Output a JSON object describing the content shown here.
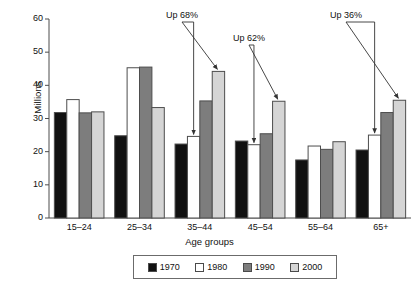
{
  "chart_data": {
    "type": "bar",
    "title": "",
    "subtitle": "",
    "xlabel": "Age groups",
    "ylabel": "Millions",
    "categories": [
      "15–24",
      "25–34",
      "35–44",
      "45–54",
      "55–64",
      "65+"
    ],
    "series": [
      {
        "name": "1970",
        "color": "#111111",
        "values": [
          31.8,
          24.8,
          22.3,
          23.2,
          17.5,
          20.5
        ]
      },
      {
        "name": "1980",
        "color": "#ffffff",
        "values": [
          35.7,
          45.3,
          24.6,
          22.1,
          21.7,
          25.0
        ]
      },
      {
        "name": "1990",
        "color": "#7d7d7d",
        "values": [
          31.7,
          45.5,
          35.3,
          25.4,
          20.7,
          31.8
        ]
      },
      {
        "name": "2000",
        "color": "#d5d5d5",
        "values": [
          32.0,
          33.3,
          44.2,
          35.2,
          23.0,
          35.5
        ]
      }
    ],
    "ylim": [
      0,
      60
    ],
    "yticks": [
      0,
      10,
      20,
      30,
      40,
      50,
      60
    ],
    "ytick_labels": [
      "0",
      "10",
      "20",
      "30",
      "40",
      "50",
      "60"
    ],
    "grid": false,
    "legend_position": "bottom",
    "annotations": [
      {
        "text": "Up 68%",
        "group": "35–44",
        "from_series": "1980",
        "to_series": "2000"
      },
      {
        "text": "Up 62%",
        "group": "45–54",
        "from_series": "1980",
        "to_series": "2000"
      },
      {
        "text": "Up 36%",
        "group": "65+",
        "from_series": "1980",
        "to_series": "2000"
      }
    ]
  },
  "legend": {
    "items": [
      {
        "label": "1970"
      },
      {
        "label": "1980"
      },
      {
        "label": "1990"
      },
      {
        "label": "2000"
      }
    ]
  },
  "colors": {
    "axis": "#4d4d4d",
    "text": "#111111",
    "bar_1970": "#111111",
    "bar_1980": "#ffffff",
    "bar_1990": "#7d7d7d",
    "bar_2000": "#d5d5d5"
  }
}
